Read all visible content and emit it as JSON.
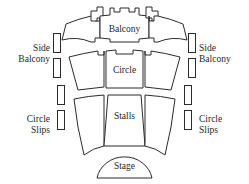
{
  "diagram": {
    "kind": "theatre-seating-plan",
    "colors": {
      "background": "#ffffff",
      "stroke": "#2b2b2b",
      "fill": "#ffffff",
      "text": "#1f1f1f"
    },
    "zones": {
      "balcony": "Balcony",
      "circle": "Circle",
      "stalls": "Stalls",
      "stage": "Stage",
      "side_balcony_left": "Side\nBalcony",
      "side_balcony_right": "Side\nBalcony",
      "circle_slips_left": "Circle\nSlips",
      "circle_slips_right": "Circle\nSlips"
    },
    "counts": {
      "balcony_blocks": 3,
      "circle_blocks": 3,
      "stalls_blocks": 3,
      "slip_bars_per_side": 4
    }
  }
}
